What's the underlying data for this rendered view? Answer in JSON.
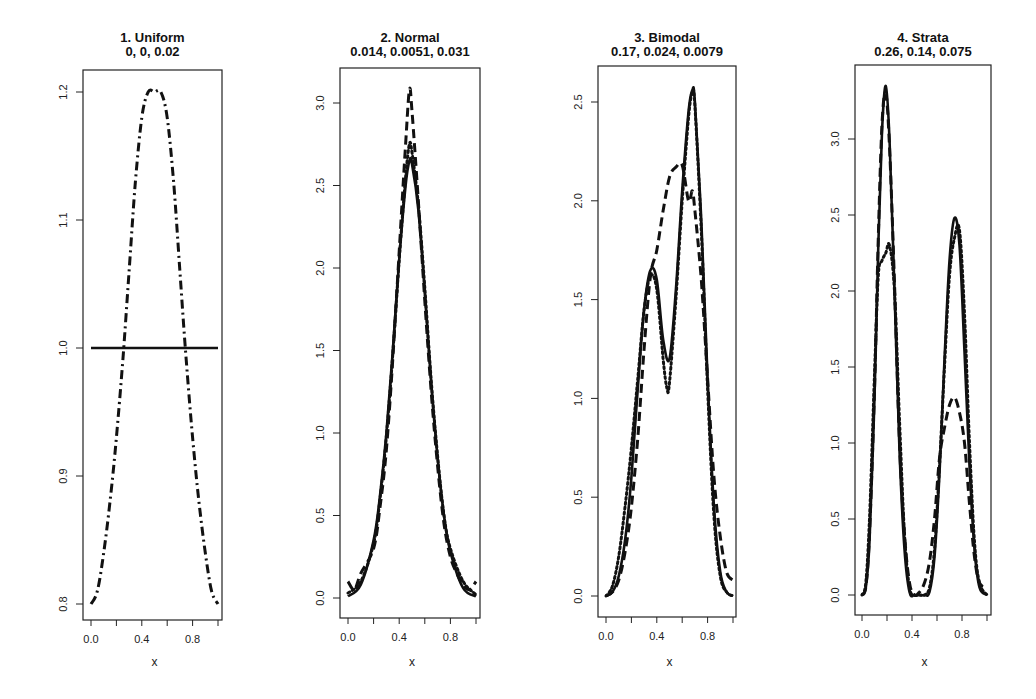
{
  "chart_data": [
    {
      "type": "line",
      "title": "1.  Uniform",
      "subtitle": "0, 0, 0.02",
      "xlabel": "x",
      "ylabel": "",
      "xlim": [
        0,
        1
      ],
      "ylim": [
        0.79,
        1.22
      ],
      "xticks": [
        0.0,
        0.2,
        0.4,
        0.6,
        0.8,
        1.0
      ],
      "xtick_labels": [
        "0.0",
        "",
        "0.4",
        "",
        "0.8",
        ""
      ],
      "yticks": [
        0.8,
        0.9,
        1.0,
        1.1,
        1.2
      ],
      "ytick_labels": [
        "0.8",
        "0.9",
        "1.0",
        "1.1",
        "1.2"
      ],
      "box": {
        "x0": 83,
        "x1": 222,
        "y0": 70,
        "y1": 620,
        "ypix": {
          "0.8": 604,
          "1.2": 92
        },
        "xpix": {
          "0": 91,
          "1": 218
        }
      },
      "grid": false,
      "series": [
        {
          "name": "true",
          "style": "solid",
          "x": [
            0.0,
            1.0
          ],
          "y": [
            1.0,
            1.0
          ]
        },
        {
          "name": "estimate",
          "style": "dashdot",
          "x": [
            0.0,
            0.05,
            0.1,
            0.15,
            0.2,
            0.25,
            0.3,
            0.35,
            0.4,
            0.45,
            0.5,
            0.55,
            0.6,
            0.65,
            0.7,
            0.75,
            0.8,
            0.85,
            0.9,
            0.95,
            1.0
          ],
          "y": [
            0.8,
            0.81,
            0.84,
            0.88,
            0.93,
            0.99,
            1.06,
            1.13,
            1.18,
            1.2,
            1.2,
            1.2,
            1.18,
            1.13,
            1.06,
            0.99,
            0.93,
            0.88,
            0.84,
            0.81,
            0.8
          ]
        }
      ]
    },
    {
      "type": "line",
      "title": "2.  Normal",
      "subtitle": "0.014, 0.0051, 0.031",
      "xlabel": "x",
      "ylabel": "",
      "xlim": [
        0,
        1
      ],
      "ylim": [
        -0.12,
        3.22
      ],
      "xticks": [
        0.0,
        0.2,
        0.4,
        0.6,
        0.8,
        1.0
      ],
      "xtick_labels": [
        "0.0",
        "",
        "0.4",
        "",
        "0.8",
        ""
      ],
      "yticks": [
        0.0,
        0.5,
        1.0,
        1.5,
        2.0,
        2.5,
        3.0
      ],
      "ytick_labels": [
        "0.0",
        "0.5",
        "1.0",
        "1.5",
        "2.0",
        "2.5",
        "3.0"
      ],
      "box": {
        "x0": 340,
        "x1": 480,
        "y0": 68,
        "y1": 618,
        "ypix": {
          "0": 598,
          "3": 103
        },
        "xpix": {
          "0": 348,
          "1": 476
        }
      },
      "grid": false,
      "series": [
        {
          "name": "true",
          "style": "solid",
          "x": [
            0.0,
            0.1,
            0.2,
            0.25,
            0.3,
            0.35,
            0.4,
            0.45,
            0.48,
            0.5,
            0.55,
            0.6,
            0.65,
            0.7,
            0.75,
            0.8,
            0.9,
            1.0
          ],
          "y": [
            0.01,
            0.08,
            0.35,
            0.62,
            1.0,
            1.5,
            2.05,
            2.5,
            2.65,
            2.63,
            2.35,
            1.85,
            1.3,
            0.85,
            0.5,
            0.28,
            0.06,
            0.01
          ]
        },
        {
          "name": "estimate-dashed",
          "style": "dashed",
          "x": [
            0.0,
            0.05,
            0.1,
            0.2,
            0.25,
            0.3,
            0.35,
            0.4,
            0.45,
            0.48,
            0.5,
            0.55,
            0.6,
            0.65,
            0.7,
            0.75,
            0.8,
            0.85,
            0.9,
            0.95,
            1.0
          ],
          "y": [
            0.1,
            0.05,
            0.15,
            0.3,
            0.55,
            0.9,
            1.45,
            2.1,
            2.75,
            3.08,
            2.95,
            2.4,
            1.8,
            1.25,
            0.8,
            0.45,
            0.25,
            0.15,
            0.08,
            0.05,
            0.1
          ]
        },
        {
          "name": "estimate-dotted",
          "style": "dotted",
          "x": [
            0.0,
            0.1,
            0.2,
            0.25,
            0.3,
            0.35,
            0.4,
            0.45,
            0.48,
            0.5,
            0.55,
            0.6,
            0.65,
            0.7,
            0.75,
            0.8,
            0.9,
            1.0
          ],
          "y": [
            0.03,
            0.1,
            0.33,
            0.6,
            0.98,
            1.48,
            2.05,
            2.55,
            2.75,
            2.7,
            2.38,
            1.88,
            1.32,
            0.86,
            0.5,
            0.3,
            0.1,
            0.02
          ]
        }
      ]
    },
    {
      "type": "line",
      "title": "3.  Bimodal",
      "subtitle": "0.17, 0.024, 0.0079",
      "xlabel": "x",
      "ylabel": "",
      "xlim": [
        0,
        1
      ],
      "ylim": [
        -0.11,
        2.68
      ],
      "xticks": [
        0.0,
        0.2,
        0.4,
        0.6,
        0.8,
        1.0
      ],
      "xtick_labels": [
        "0.0",
        "",
        "0.4",
        "",
        "0.8",
        ""
      ],
      "yticks": [
        0.0,
        0.5,
        1.0,
        1.5,
        2.0,
        2.5
      ],
      "ytick_labels": [
        "0.0",
        "0.5",
        "1.0",
        "1.5",
        "2.0",
        "2.5"
      ],
      "box": {
        "x0": 598,
        "x1": 736,
        "y0": 66,
        "y1": 617,
        "ypix": {
          "0": 596,
          "2.5": 102
        },
        "xpix": {
          "0": 606,
          "1": 733
        }
      },
      "grid": false,
      "series": [
        {
          "name": "true",
          "style": "solid",
          "x": [
            0.0,
            0.05,
            0.1,
            0.15,
            0.2,
            0.25,
            0.3,
            0.35,
            0.4,
            0.45,
            0.5,
            0.55,
            0.6,
            0.65,
            0.68,
            0.7,
            0.75,
            0.8,
            0.85,
            0.9,
            0.95,
            1.0
          ],
          "y": [
            0.0,
            0.02,
            0.1,
            0.28,
            0.6,
            1.05,
            1.45,
            1.65,
            1.6,
            1.3,
            1.2,
            1.55,
            2.05,
            2.45,
            2.56,
            2.5,
            1.9,
            1.1,
            0.45,
            0.12,
            0.02,
            0.0
          ]
        },
        {
          "name": "estimate-dashed",
          "style": "dashed",
          "x": [
            0.0,
            0.05,
            0.1,
            0.15,
            0.2,
            0.25,
            0.3,
            0.35,
            0.4,
            0.45,
            0.5,
            0.55,
            0.6,
            0.65,
            0.68,
            0.7,
            0.75,
            0.8,
            0.85,
            0.9,
            0.95,
            1.0
          ],
          "y": [
            0.0,
            0.02,
            0.08,
            0.22,
            0.45,
            0.8,
            1.25,
            1.62,
            1.75,
            1.95,
            2.12,
            2.17,
            2.18,
            2.0,
            2.05,
            1.95,
            1.6,
            1.1,
            0.6,
            0.3,
            0.12,
            0.08
          ]
        },
        {
          "name": "estimate-dotted",
          "style": "dotted",
          "x": [
            0.0,
            0.05,
            0.1,
            0.15,
            0.2,
            0.25,
            0.3,
            0.35,
            0.4,
            0.45,
            0.48,
            0.5,
            0.55,
            0.6,
            0.65,
            0.68,
            0.7,
            0.75,
            0.8,
            0.85,
            0.9,
            0.95,
            1.0
          ],
          "y": [
            0.0,
            0.05,
            0.2,
            0.45,
            0.75,
            1.1,
            1.45,
            1.62,
            1.55,
            1.2,
            1.05,
            1.08,
            1.5,
            2.0,
            2.42,
            2.55,
            2.48,
            1.85,
            1.05,
            0.4,
            0.1,
            0.02,
            0.0
          ]
        }
      ]
    },
    {
      "type": "line",
      "title": "4.  Strata",
      "subtitle": "0.26, 0.14, 0.075",
      "xlabel": "x",
      "ylabel": "",
      "xlim": [
        0,
        1
      ],
      "ylim": [
        -0.13,
        3.5
      ],
      "xticks": [
        0.0,
        0.2,
        0.4,
        0.6,
        0.8,
        1.0
      ],
      "xtick_labels": [
        "0.0",
        "",
        "0.4",
        "",
        "0.8",
        ""
      ],
      "yticks": [
        0.0,
        0.5,
        1.0,
        1.5,
        2.0,
        2.5,
        3.0
      ],
      "ytick_labels": [
        "0.0",
        "0.5",
        "1.0",
        "1.5",
        "2.0",
        "2.5",
        "3.0"
      ],
      "box": {
        "x0": 855,
        "x1": 991,
        "y0": 65,
        "y1": 615,
        "ypix": {
          "0": 595,
          "3": 139
        },
        "xpix": {
          "0": 862,
          "1": 987
        }
      },
      "grid": false,
      "series": [
        {
          "name": "true",
          "style": "solid",
          "x": [
            0.0,
            0.03,
            0.06,
            0.1,
            0.13,
            0.16,
            0.19,
            0.22,
            0.26,
            0.3,
            0.34,
            0.38,
            0.42,
            0.46,
            0.5,
            0.54,
            0.58,
            0.62,
            0.66,
            0.7,
            0.74,
            0.78,
            0.82,
            0.86,
            0.9,
            0.94,
            1.0
          ],
          "y": [
            0.0,
            0.05,
            0.35,
            1.3,
            2.3,
            3.05,
            3.35,
            3.0,
            2.0,
            0.95,
            0.3,
            0.02,
            0.0,
            0.0,
            0.0,
            0.02,
            0.25,
            0.8,
            1.55,
            2.2,
            2.48,
            2.3,
            1.6,
            0.85,
            0.3,
            0.05,
            0.0
          ]
        },
        {
          "name": "estimate-dashed",
          "style": "dashed",
          "x": [
            0.0,
            0.03,
            0.06,
            0.1,
            0.13,
            0.16,
            0.19,
            0.22,
            0.26,
            0.3,
            0.34,
            0.38,
            0.42,
            0.46,
            0.5,
            0.54,
            0.58,
            0.62,
            0.66,
            0.7,
            0.74,
            0.78,
            0.82,
            0.86,
            0.9,
            0.94,
            1.0
          ],
          "y": [
            0.0,
            0.05,
            0.4,
            1.35,
            2.35,
            3.1,
            3.3,
            2.95,
            2.05,
            1.0,
            0.4,
            0.08,
            0.0,
            0.02,
            0.08,
            0.22,
            0.5,
            0.9,
            1.1,
            1.25,
            1.3,
            1.2,
            1.0,
            0.6,
            0.25,
            0.08,
            0.05
          ]
        },
        {
          "name": "estimate-dotted",
          "style": "dotted",
          "x": [
            0.0,
            0.03,
            0.06,
            0.1,
            0.13,
            0.16,
            0.19,
            0.22,
            0.26,
            0.3,
            0.34,
            0.38,
            0.42,
            0.46,
            0.5,
            0.54,
            0.58,
            0.62,
            0.66,
            0.7,
            0.74,
            0.78,
            0.82,
            0.86,
            0.9,
            0.94,
            1.0
          ],
          "y": [
            0.0,
            0.08,
            0.5,
            1.45,
            2.1,
            2.2,
            2.25,
            2.3,
            2.0,
            1.15,
            0.4,
            0.05,
            0.0,
            0.0,
            0.0,
            0.05,
            0.3,
            0.85,
            1.5,
            2.1,
            2.35,
            2.4,
            1.85,
            1.0,
            0.35,
            0.08,
            0.0
          ]
        }
      ]
    }
  ]
}
